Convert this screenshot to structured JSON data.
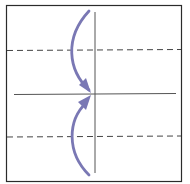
{
  "diagram": {
    "type": "origami-fold-instruction",
    "colors": {
      "paper_border": "#2b2b2b",
      "crease": "#555555",
      "fold_line": "#444444",
      "arrow": "#7a78b4",
      "background": "#ffffff"
    },
    "elements": {
      "paper": "square-sheet",
      "vertical_crease": "center-vertical-crease",
      "horizontal_crease": "center-horizontal-crease",
      "fold_lines": [
        "top-dashed-valley-fold",
        "bottom-dashed-valley-fold"
      ],
      "arrows": [
        "top-edge-to-center-arrow",
        "bottom-edge-to-center-arrow"
      ]
    }
  }
}
